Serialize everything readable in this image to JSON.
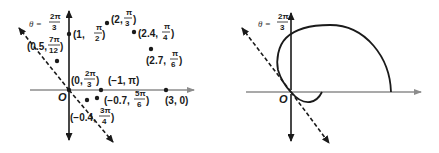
{
  "figure": {
    "left_panel": {
      "title": "Plotted polar points",
      "theta_line_label": {
        "prefix": "θ =",
        "num": "2π",
        "den": "3"
      },
      "origin_label": "O",
      "points": [
        {
          "id": "p1",
          "label_pre": "(1,",
          "num": "π",
          "den": "2",
          "label_post": ")",
          "r": 1,
          "theta": "π/2"
        },
        {
          "id": "p2",
          "label_pre": "(2,",
          "num": "π",
          "den": "3",
          "label_post": ")",
          "r": 2,
          "theta": "π/3"
        },
        {
          "id": "p3",
          "label_pre": "(2.4,",
          "num": "π",
          "den": "4",
          "label_post": ")",
          "r": 2.4,
          "theta": "π/4"
        },
        {
          "id": "p4",
          "label_pre": "(2.7,",
          "num": "π",
          "den": "6",
          "label_post": ")",
          "r": 2.7,
          "theta": "π/6"
        },
        {
          "id": "p5",
          "label_pre": "(0.5,",
          "num": "7π",
          "den": "12",
          "label_post": ")",
          "r": 0.5,
          "theta": "7π/12"
        },
        {
          "id": "p6",
          "label_pre": "(0,",
          "num": "2π",
          "den": "3",
          "label_post": ")",
          "r": 0,
          "theta": "2π/3"
        },
        {
          "id": "p7",
          "label_pre": "(−1, π)",
          "num": "",
          "den": "",
          "label_post": "",
          "r": -1,
          "theta": "π"
        },
        {
          "id": "p8",
          "label_pre": "(−0.7,",
          "num": "5π",
          "den": "6",
          "label_post": ")",
          "r": -0.7,
          "theta": "5π/6"
        },
        {
          "id": "p9",
          "label_pre": "(−0.4,",
          "num": "3π",
          "den": "4",
          "label_post": ")",
          "r": -0.4,
          "theta": "3π/4"
        },
        {
          "id": "p10",
          "label_pre": "(3, 0)",
          "num": "",
          "den": "",
          "label_post": "",
          "r": 3,
          "theta": "0"
        }
      ]
    },
    "right_panel": {
      "title": "Connected polar curve",
      "theta_line_label": {
        "prefix": "θ =",
        "num": "2π",
        "den": "3"
      },
      "origin_label": "O"
    },
    "colors": {
      "axis_horizontal": "#8c8c8c",
      "axis_vertical": "#1a1a1a",
      "curve": "#1a1a1a",
      "point": "#1a1a1a",
      "background": "#ffffff"
    }
  }
}
